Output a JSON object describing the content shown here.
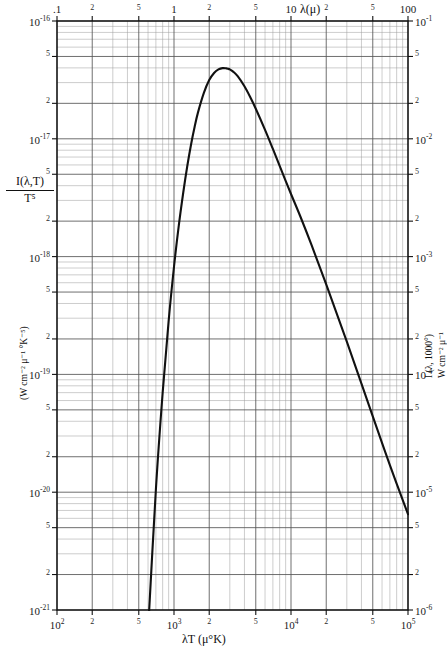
{
  "chart_data": {
    "type": "line",
    "title": "",
    "subtitle": "",
    "xlabel": "λT (μ°K)",
    "ylabel": "I(λ,T)/T⁵",
    "ylabel_units": "(W cm⁻² μ⁻¹ °K⁻⁵)",
    "top_axis_label": "λ(μ)",
    "right_axis_label": "I (λ, 1000°)",
    "right_axis_units": "W cm⁻² μ⁻¹",
    "scale": "log-log",
    "grid": true,
    "legend": "none",
    "xlim": [
      100,
      100000
    ],
    "ylim": [
      1e-21,
      1e-16
    ],
    "top_xlim": [
      0.1,
      100
    ],
    "right_ylim": [
      1e-06,
      0.1
    ],
    "x_tick_labels": [
      "10²",
      "2",
      "5",
      "10³",
      "2",
      "5",
      "10⁴",
      "2",
      "5",
      "10⁵"
    ],
    "x_tick_values": [
      100,
      200,
      500,
      1000,
      2000,
      5000,
      10000,
      20000,
      50000,
      100000
    ],
    "y_tick_labels": [
      "10⁻¹⁶",
      "5",
      "2",
      "10⁻¹⁷",
      "5",
      "2",
      "10⁻¹⁸",
      "5",
      "2",
      "10⁻¹⁹",
      "5",
      "2",
      "10⁻²⁰",
      "5",
      "2",
      "10⁻²¹"
    ],
    "y_tick_values": [
      1e-16,
      5e-17,
      2e-17,
      1e-17,
      5e-18,
      2e-18,
      1e-18,
      5e-19,
      2e-19,
      1e-19,
      5e-20,
      2e-20,
      1e-20,
      5e-21,
      2e-21,
      1e-21
    ],
    "top_tick_labels": [
      ".1",
      "2",
      "5",
      "1",
      "2",
      "5",
      "10",
      "2",
      "5",
      "100"
    ],
    "top_tick_values": [
      0.1,
      0.2,
      0.5,
      1,
      2,
      5,
      10,
      20,
      50,
      100
    ],
    "right_tick_labels": [
      "10⁻¹",
      "5",
      "2",
      "10⁻²",
      "5",
      "2",
      "10⁻³",
      "5",
      "2",
      "10⁻⁴",
      "5",
      "2",
      "10⁻⁵",
      "5",
      "2",
      "10⁻⁶"
    ],
    "right_tick_values": [
      0.1,
      0.05,
      0.02,
      0.01,
      0.005,
      0.002,
      0.001,
      0.0005,
      0.0002,
      0.0001,
      5e-05,
      2e-05,
      1e-05,
      5e-06,
      2e-06,
      1e-06
    ],
    "series": [
      {
        "name": "Planck blackbody spectral radiance (normalized)",
        "x": [
          600,
          700,
          800,
          900,
          1000,
          1100,
          1200,
          1300,
          1400,
          1500,
          1600,
          1800,
          2000,
          2200,
          2400,
          2600,
          2800,
          2898,
          3000,
          3200,
          3500,
          4000,
          4500,
          5000,
          6000,
          7000,
          8000,
          9000,
          10000,
          12000,
          15000,
          20000,
          30000,
          50000,
          70000,
          100000
        ],
        "y": [
          6.6e-22,
          1.05e-20,
          7e-20,
          2.85e-19,
          8.2e-19,
          1.85e-18,
          3.5e-18,
          5.9e-18,
          9e-18,
          1.26e-17,
          1.66e-17,
          2.45e-17,
          3.15e-17,
          3.62e-17,
          3.88e-17,
          3.98e-17,
          3.96e-17,
          3.93e-17,
          3.88e-17,
          3.72e-17,
          3.4e-17,
          2.79e-17,
          2.24e-17,
          1.8e-17,
          1.19e-17,
          8.2e-18,
          5.9e-18,
          4.4e-18,
          3.4e-18,
          2.2e-18,
          1.25e-18,
          5.8e-19,
          1.9e-19,
          4.4e-20,
          1.7e-20,
          6.5e-21
        ]
      }
    ],
    "annotations": []
  },
  "axes": {
    "top": {
      "label": "λ(μ)",
      "ticks": [
        ".1",
        "2",
        "5",
        "1",
        "2",
        "5",
        "10",
        "2",
        "5",
        "100"
      ]
    },
    "bottom": {
      "label": "λT (μ°K)",
      "ticks": [
        "10²",
        "2",
        "5",
        "10³",
        "2",
        "5",
        "10⁴",
        "2",
        "5",
        "10⁵"
      ]
    },
    "left": {
      "label_numerator": "I(λ,T)",
      "label_denominator": "T⁵",
      "units": "(W cm⁻² μ⁻¹ °K⁻⁵)",
      "ticks": [
        "10⁻¹⁶",
        "5",
        "2",
        "10⁻¹⁷",
        "5",
        "2",
        "10⁻¹⁸",
        "5",
        "2",
        "10⁻¹⁹",
        "5",
        "2",
        "10⁻²⁰",
        "5",
        "2",
        "10⁻²¹"
      ]
    },
    "right": {
      "label": "I (λ, 1000°)",
      "units": "W cm⁻² μ⁻¹",
      "ticks": [
        "10⁻¹",
        "5",
        "2",
        "10⁻²",
        "5",
        "2",
        "10⁻³",
        "5",
        "2",
        "10⁻⁴",
        "5",
        "2",
        "10⁻⁵",
        "5",
        "2",
        "10⁻⁶"
      ]
    }
  },
  "style": {
    "curve_color": "#111111",
    "major_grid_color": "#555555",
    "minor_grid_color": "#9a9a9a",
    "frame_color": "#111111",
    "background": "#ffffff"
  }
}
